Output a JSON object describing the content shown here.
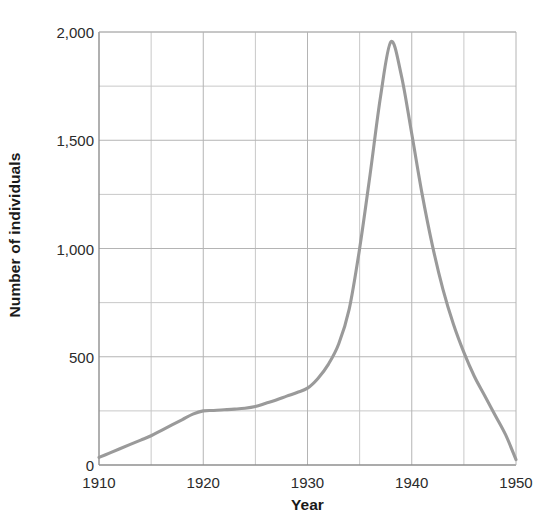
{
  "chart_data": {
    "type": "line",
    "title": "",
    "xlabel": "Year",
    "ylabel": "Number of individuals",
    "xlim": [
      1910,
      1950
    ],
    "ylim": [
      0,
      2000
    ],
    "grid": true,
    "legend": "none",
    "x_major_ticks": [
      1910,
      1920,
      1930,
      1940,
      1950
    ],
    "x_major_tick_labels": [
      "1910",
      "1920",
      "1930",
      "1940",
      "1950"
    ],
    "x_minor_ticks": [
      1915,
      1925,
      1935,
      1945
    ],
    "y_major_ticks": [
      0,
      500,
      1000,
      1500,
      2000
    ],
    "y_major_tick_labels": [
      "0",
      "500",
      "1,000",
      "1,500",
      "2,000"
    ],
    "y_minor_ticks": [
      250,
      750,
      1250,
      1750
    ],
    "line_color": "#9a9a9a",
    "series": [
      {
        "name": "Number of individuals",
        "x": [
          1910,
          1911,
          1912,
          1913,
          1914,
          1915,
          1916,
          1917,
          1918,
          1919,
          1920,
          1921,
          1922,
          1923,
          1924,
          1925,
          1926,
          1927,
          1928,
          1929,
          1930,
          1931,
          1932,
          1933,
          1934,
          1935,
          1936,
          1937,
          1938,
          1939,
          1940,
          1941,
          1942,
          1943,
          1944,
          1945,
          1946,
          1947,
          1948,
          1949,
          1950
        ],
        "values": [
          35,
          55,
          75,
          95,
          115,
          135,
          160,
          185,
          210,
          235,
          250,
          252,
          255,
          258,
          262,
          270,
          285,
          300,
          318,
          335,
          355,
          400,
          465,
          560,
          720,
          1000,
          1340,
          1700,
          1955,
          1800,
          1530,
          1250,
          1010,
          810,
          650,
          520,
          410,
          320,
          230,
          140,
          25
        ]
      }
    ]
  },
  "axes": {
    "y_title": "Number of individuals",
    "x_title": "Year"
  }
}
